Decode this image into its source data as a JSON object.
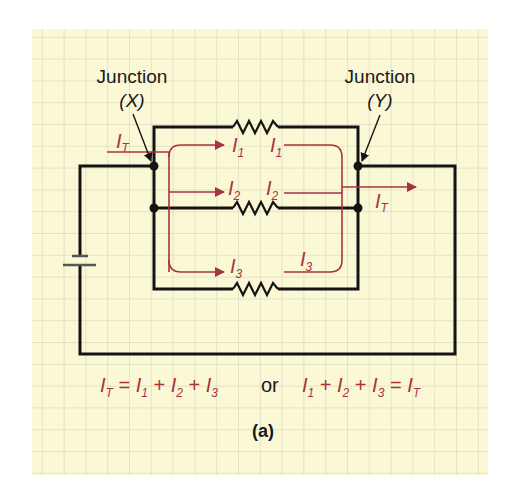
{
  "colors": {
    "paper": "#fbf8d6",
    "grid": "#cfcdb8",
    "wire": "#141414",
    "current": "#a83240"
  },
  "junctions": {
    "left": {
      "title": "Junction",
      "name": "(X)"
    },
    "right": {
      "title": "Junction",
      "name": "(Y)"
    }
  },
  "currents": {
    "total": {
      "main": "I",
      "sub": "T"
    },
    "i1": {
      "main": "I",
      "sub": "1"
    },
    "i2": {
      "main": "I",
      "sub": "2"
    },
    "i3": {
      "main": "I",
      "sub": "3"
    }
  },
  "equation": {
    "left": {
      "t_main": "I",
      "t_sub": "T",
      "eq": " = ",
      "a_main": "I",
      "a_sub": "1",
      "p1": " + ",
      "b_main": "I",
      "b_sub": "2",
      "p2": " + ",
      "c_main": "I",
      "c_sub": "3"
    },
    "connector": "or",
    "right": {
      "a_main": "I",
      "a_sub": "1",
      "p1": " + ",
      "b_main": "I",
      "b_sub": "2",
      "p2": " + ",
      "c_main": "I",
      "c_sub": "3",
      "eq": " = ",
      "t_main": "I",
      "t_sub": "T"
    }
  },
  "caption": "(a)",
  "components": {
    "battery": "battery-icon",
    "resistors": [
      "resistor-1",
      "resistor-2",
      "resistor-3"
    ]
  }
}
